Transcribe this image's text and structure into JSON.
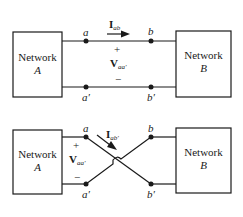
{
  "diagrams": [
    {
      "id": "straight",
      "network_left": {
        "name": "Network",
        "letter": "A"
      },
      "network_right": {
        "name": "Network",
        "letter": "B"
      },
      "nodes": {
        "a": "a",
        "b": "b",
        "a_prime": "a′",
        "b_prime": "b′"
      },
      "current": {
        "symbol": "I",
        "subscript": "ab"
      },
      "voltage": {
        "symbol": "V",
        "subscript": "aa′",
        "plus": "+",
        "minus": "−"
      }
    },
    {
      "id": "crossed",
      "network_left": {
        "name": "Network",
        "letter": "A"
      },
      "network_right": {
        "name": "Network",
        "letter": "B"
      },
      "nodes": {
        "a": "a",
        "b": "b",
        "a_prime": "a′",
        "b_prime": "b′"
      },
      "current": {
        "symbol": "I",
        "subscript": "ab′"
      },
      "voltage": {
        "symbol": "V",
        "subscript": "aa′",
        "plus": "+",
        "minus": "−"
      }
    }
  ]
}
